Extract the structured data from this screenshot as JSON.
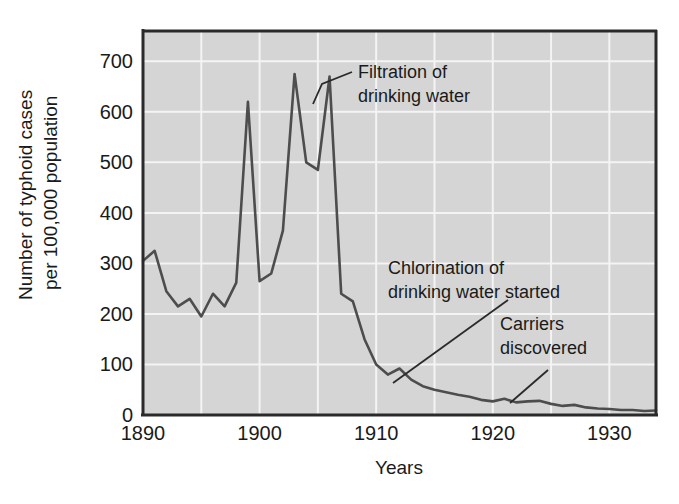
{
  "figure": {
    "background_color": "#ffffff",
    "plot_background_color": "#d5d5d5",
    "grid_color": "#f2f2f2",
    "axis_color": "#2a2a2a",
    "line_color": "#4a4a4a"
  },
  "chart_data": {
    "type": "line",
    "title": "",
    "xlabel": "Years",
    "ylabel": "Number of typhoid cases per 100,000 population",
    "ylabel_line1": "Number of typhoid cases",
    "ylabel_line2": "per 100,000 population",
    "xlim": [
      1890,
      1934
    ],
    "ylim": [
      0,
      760
    ],
    "yticks": [
      0,
      100,
      200,
      300,
      400,
      500,
      600,
      700
    ],
    "ytick_labels": [
      "0",
      "100",
      "200",
      "300",
      "400",
      "500",
      "600",
      "700"
    ],
    "xticks": [
      1890,
      1900,
      1910,
      1920,
      1930
    ],
    "xtick_labels": [
      "1890",
      "1900",
      "1910",
      "1920",
      "1930"
    ],
    "x_minor_gridlines": [
      1895,
      1900,
      1905,
      1910,
      1915,
      1920,
      1925,
      1930
    ],
    "grid": true,
    "legend": "none",
    "series": [
      {
        "name": "Typhoid fever case rate",
        "x": [
          1890,
          1891,
          1892,
          1893,
          1894,
          1895,
          1896,
          1897,
          1898,
          1899,
          1900,
          1901,
          1902,
          1903,
          1904,
          1905,
          1906,
          1907,
          1908,
          1909,
          1910,
          1911,
          1912,
          1913,
          1914,
          1915,
          1916,
          1917,
          1918,
          1919,
          1920,
          1921,
          1922,
          1923,
          1924,
          1925,
          1926,
          1927,
          1928,
          1929,
          1930,
          1931,
          1932,
          1933,
          1934
        ],
        "values": [
          305,
          325,
          245,
          215,
          230,
          195,
          240,
          215,
          262,
          620,
          265,
          280,
          365,
          675,
          500,
          485,
          670,
          240,
          225,
          150,
          100,
          80,
          92,
          70,
          57,
          50,
          45,
          40,
          36,
          30,
          27,
          32,
          25,
          27,
          28,
          22,
          18,
          20,
          15,
          13,
          12,
          10,
          10,
          8,
          9
        ]
      }
    ],
    "annotations": [
      {
        "id": "filtration",
        "lines": [
          "Filtration of",
          "drinking water"
        ],
        "text_x": 358,
        "text_y": 78,
        "leader": [
          [
            352,
            72
          ],
          [
            322,
            84
          ],
          [
            313,
            104
          ]
        ]
      },
      {
        "id": "chlorination",
        "lines": [
          "Chlorination of",
          "drinking water started"
        ],
        "text_x": 388,
        "text_y": 274,
        "leader": [
          [
            508,
            300
          ],
          [
            393,
            383
          ]
        ]
      },
      {
        "id": "carriers",
        "lines": [
          "Carriers",
          "discovered"
        ],
        "text_x": 500,
        "text_y": 330,
        "leader": [
          [
            548,
            370
          ],
          [
            510,
            403
          ]
        ]
      }
    ]
  }
}
